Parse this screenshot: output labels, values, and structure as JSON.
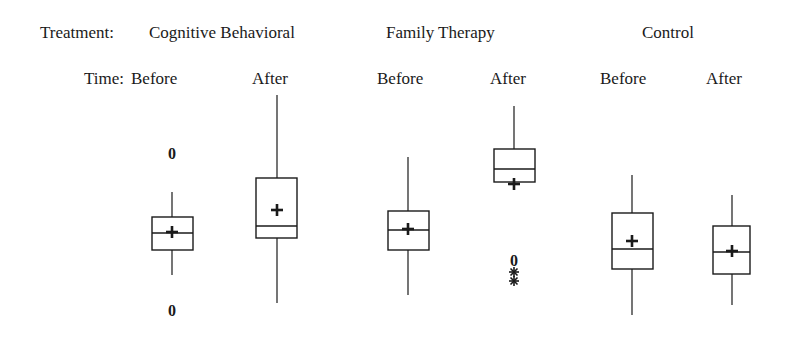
{
  "header": {
    "treatment_label": "Treatment:",
    "time_label": "Time:",
    "treatments": [
      {
        "label": "Cognitive Behavioral"
      },
      {
        "label": "Family Therapy"
      },
      {
        "label": "Control"
      }
    ],
    "times": [
      {
        "label": "Before"
      },
      {
        "label": "After"
      },
      {
        "label": "Before"
      },
      {
        "label": "After"
      },
      {
        "label": "Before"
      },
      {
        "label": "After"
      }
    ]
  },
  "legend_symbols": {
    "mean": "+",
    "mild_outlier": "0",
    "extreme_outlier": "*"
  },
  "chart_data": {
    "type": "boxplot",
    "title": "",
    "xlabel": "",
    "ylabel": "",
    "y_units": "pixel position (no y-axis shown; smaller = higher on page)",
    "grid": false,
    "legend_position": "none",
    "factor_labels": {
      "treatment": "Treatment",
      "time": "Time"
    },
    "categories": [
      "Cognitive Behavioral / Before",
      "Cognitive Behavioral / After",
      "Family Therapy / Before",
      "Family Therapy / After",
      "Control / Before",
      "Control / After"
    ],
    "series": [
      {
        "treatment": "Cognitive Behavioral",
        "time": "Before",
        "x": 172,
        "box_left": 152,
        "box_right": 193,
        "whisker_top": 192,
        "q3": 217,
        "median": 233,
        "q1": 250,
        "whisker_bottom": 275,
        "mean": 232,
        "outliers": [
          {
            "y": 153,
            "symbol": "0"
          },
          {
            "y": 310,
            "symbol": "0"
          }
        ]
      },
      {
        "treatment": "Cognitive Behavioral",
        "time": "After",
        "x": 277,
        "box_left": 256,
        "box_right": 297,
        "whisker_top": 95,
        "q3": 178,
        "median": 226,
        "q1": 238,
        "whisker_bottom": 303,
        "mean": 210,
        "outliers": []
      },
      {
        "treatment": "Family Therapy",
        "time": "Before",
        "x": 408,
        "box_left": 388,
        "box_right": 429,
        "whisker_top": 157,
        "q3": 211,
        "median": 230,
        "q1": 250,
        "whisker_bottom": 295,
        "mean": 229,
        "outliers": []
      },
      {
        "treatment": "Family Therapy",
        "time": "After",
        "x": 514,
        "box_left": 494,
        "box_right": 535,
        "whisker_top": 106,
        "q3": 149,
        "median": 169,
        "q1": 182,
        "whisker_bottom": 182,
        "mean": 184,
        "outliers": [
          {
            "y": 260,
            "symbol": "0"
          },
          {
            "y": 272,
            "symbol": "*"
          },
          {
            "y": 281,
            "symbol": "*"
          }
        ]
      },
      {
        "treatment": "Control",
        "time": "Before",
        "x": 632,
        "box_left": 612,
        "box_right": 653,
        "whisker_top": 175,
        "q3": 213,
        "median": 249,
        "q1": 269,
        "whisker_bottom": 315,
        "mean": 241,
        "outliers": []
      },
      {
        "treatment": "Control",
        "time": "After",
        "x": 732,
        "box_left": 713,
        "box_right": 750,
        "whisker_top": 195,
        "q3": 226,
        "median": 252,
        "q1": 274,
        "whisker_bottom": 305,
        "mean": 251,
        "outliers": []
      }
    ]
  }
}
